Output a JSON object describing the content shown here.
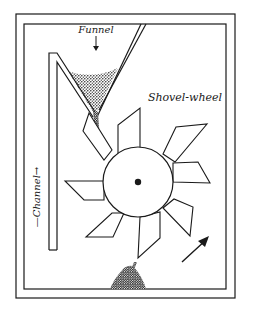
{
  "diagram": {
    "labels": {
      "funnel": "Funnel",
      "shovel_wheel": "Shovel-wheel",
      "channel": "—Channel→"
    },
    "colors": {
      "ink": "#1a1a1a",
      "background": "#ffffff"
    },
    "components": [
      "outer-frame",
      "inner-frame",
      "funnel",
      "sand-in-funnel",
      "falling-sand",
      "channel",
      "shovel-wheel",
      "axle",
      "sand-pile",
      "rotation-arrow"
    ],
    "wheel": {
      "blade_count": 8,
      "rotation": "counter-clockwise"
    }
  }
}
